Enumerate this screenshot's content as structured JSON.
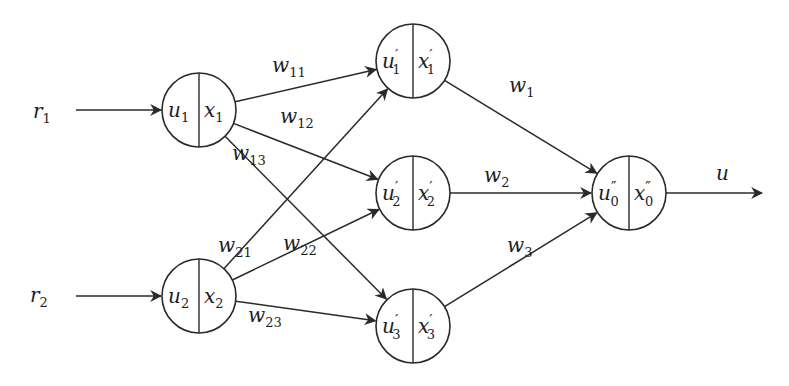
{
  "diagram": {
    "type": "neural-network",
    "colors": {
      "stroke": "#2a2a2a",
      "text": "#1e1e1e",
      "background": "#ffffff"
    },
    "node_radius": 37,
    "nodes": [
      {
        "id": "n1",
        "layer": "input",
        "cx": 199,
        "cy": 110,
        "left": {
          "base": "u",
          "sub": "1",
          "prime": ""
        },
        "right": {
          "base": "x",
          "sub": "1",
          "prime": ""
        }
      },
      {
        "id": "n2",
        "layer": "input",
        "cx": 199,
        "cy": 296,
        "left": {
          "base": "u",
          "sub": "2",
          "prime": ""
        },
        "right": {
          "base": "x",
          "sub": "2",
          "prime": ""
        }
      },
      {
        "id": "h1",
        "layer": "hidden",
        "cx": 413,
        "cy": 61,
        "left": {
          "base": "u",
          "sub": "1",
          "prime": "′"
        },
        "right": {
          "base": "x",
          "sub": "1",
          "prime": "′"
        }
      },
      {
        "id": "h2",
        "layer": "hidden",
        "cx": 413,
        "cy": 193,
        "left": {
          "base": "u",
          "sub": "2",
          "prime": "′"
        },
        "right": {
          "base": "x",
          "sub": "2",
          "prime": "′"
        }
      },
      {
        "id": "h3",
        "layer": "hidden",
        "cx": 413,
        "cy": 326,
        "left": {
          "base": "u",
          "sub": "3",
          "prime": "′"
        },
        "right": {
          "base": "x",
          "sub": "3",
          "prime": "′"
        }
      },
      {
        "id": "out",
        "layer": "output",
        "cx": 629,
        "cy": 193,
        "left": {
          "base": "u",
          "sub": "0",
          "prime": "″"
        },
        "right": {
          "base": "x",
          "sub": "0",
          "prime": "″"
        }
      }
    ],
    "inputs": [
      {
        "id": "r1",
        "label": {
          "base": "r",
          "sub": "1"
        },
        "label_x": 33,
        "label_y": 118,
        "x1": 76,
        "y1": 105,
        "target": "n1"
      },
      {
        "id": "r2",
        "label": {
          "base": "r",
          "sub": "2"
        },
        "label_x": 30,
        "label_y": 302,
        "x1": 76,
        "y1": 288,
        "target": "n2"
      }
    ],
    "output": {
      "id": "u",
      "label": {
        "base": "u",
        "sub": ""
      },
      "label_x": 716,
      "label_y": 180,
      "x2": 762,
      "source": "out"
    },
    "edges": [
      {
        "from": "n1",
        "to": "h1",
        "weight": {
          "base": "w",
          "sub": "11"
        },
        "lx": 272,
        "ly": 72
      },
      {
        "from": "n1",
        "to": "h2",
        "weight": {
          "base": "w",
          "sub": "12"
        },
        "lx": 280,
        "ly": 123
      },
      {
        "from": "n1",
        "to": "h3",
        "weight": {
          "base": "w",
          "sub": "13"
        },
        "lx": 232,
        "ly": 160
      },
      {
        "from": "n2",
        "to": "h1",
        "weight": {
          "base": "w",
          "sub": "21"
        },
        "lx": 218,
        "ly": 252
      },
      {
        "from": "n2",
        "to": "h2",
        "weight": {
          "base": "w",
          "sub": "22"
        },
        "lx": 283,
        "ly": 250
      },
      {
        "from": "n2",
        "to": "h3",
        "weight": {
          "base": "w",
          "sub": "23"
        },
        "lx": 248,
        "ly": 322
      },
      {
        "from": "h1",
        "to": "out",
        "weight": {
          "base": "w",
          "sub": "1"
        },
        "lx": 509,
        "ly": 92
      },
      {
        "from": "h2",
        "to": "out",
        "weight": {
          "base": "w",
          "sub": "2"
        },
        "lx": 484,
        "ly": 182
      },
      {
        "from": "h3",
        "to": "out",
        "weight": {
          "base": "w",
          "sub": "3"
        },
        "lx": 507,
        "ly": 252
      }
    ]
  }
}
